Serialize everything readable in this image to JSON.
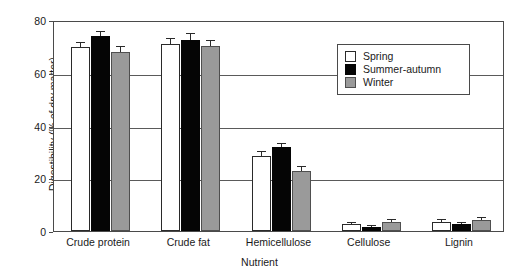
{
  "chart_data": {
    "type": "bar",
    "title": "",
    "xlabel": "Nutrient",
    "ylabel": "Digestibility (% of dry matter)",
    "ylim": [
      0,
      80
    ],
    "yticks": [
      0,
      20,
      40,
      60,
      80
    ],
    "grid": true,
    "legend_position": "upper-right-inside",
    "categories": [
      "Crude protein",
      "Crude fat",
      "Hemicellulose",
      "Cellulose",
      "Lignin"
    ],
    "series": [
      {
        "name": "Spring",
        "color": "#ffffff",
        "values": [
          69.7,
          70.8,
          28.5,
          2.5,
          3.5
        ],
        "errors": [
          2.0,
          2.3,
          2.0,
          1.0,
          1.2
        ]
      },
      {
        "name": "Summer-autumn",
        "color": "#050505",
        "values": [
          74.0,
          72.5,
          32.0,
          1.5,
          2.5
        ],
        "errors": [
          1.7,
          2.6,
          1.5,
          0.9,
          1.0
        ]
      },
      {
        "name": "Winter",
        "color": "#9a9a9a",
        "values": [
          67.8,
          70.0,
          22.8,
          3.5,
          4.0
        ],
        "errors": [
          2.3,
          2.5,
          1.8,
          1.2,
          1.3
        ]
      }
    ]
  },
  "legend": {
    "items": [
      {
        "label": "Spring",
        "swatch": "white-square-swatch"
      },
      {
        "label": "Summer-autumn",
        "swatch": "black-square-swatch"
      },
      {
        "label": "Winter",
        "swatch": "gray-square-swatch"
      }
    ]
  }
}
